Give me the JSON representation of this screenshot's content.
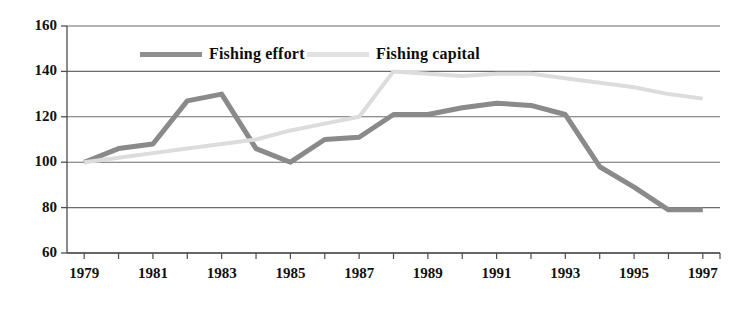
{
  "chart_data": {
    "type": "line",
    "title": "",
    "xlabel": "",
    "ylabel": "",
    "x": [
      1979,
      1980,
      1981,
      1982,
      1983,
      1984,
      1985,
      1986,
      1987,
      1988,
      1989,
      1990,
      1991,
      1992,
      1993,
      1994,
      1995,
      1996,
      1997
    ],
    "xlim": [
      1978.5,
      1997.5
    ],
    "ylim": [
      60,
      160
    ],
    "ytick_values": [
      60,
      80,
      100,
      120,
      140,
      160
    ],
    "ytick_labels": [
      "60",
      "80",
      "100",
      "120",
      "140",
      "160"
    ],
    "xtick_values": [
      1979,
      1981,
      1983,
      1985,
      1987,
      1989,
      1991,
      1993,
      1995,
      1997
    ],
    "xtick_labels": [
      "1979",
      "1981",
      "1983",
      "1985",
      "1987",
      "1989",
      "1991",
      "1993",
      "1995",
      "1997"
    ],
    "xtick_minor_values": [
      1980,
      1982,
      1984,
      1986,
      1988,
      1990,
      1992,
      1994,
      1996
    ],
    "grid": "horizontal",
    "legend_position": "top-inside",
    "series": [
      {
        "name": "Fishing effort",
        "color": "#8a8a8a",
        "line_width": 5,
        "values": [
          100,
          106,
          108,
          127,
          130,
          106,
          100,
          110,
          111,
          121,
          121,
          124,
          126,
          125,
          121,
          98,
          89,
          79,
          79
        ]
      },
      {
        "name": "Fishing capital",
        "color": "#dcdcdc",
        "line_width": 4,
        "values": [
          100,
          102,
          104,
          106,
          108,
          110,
          114,
          117,
          120,
          140,
          139,
          138,
          139,
          139,
          137,
          135,
          133,
          130,
          128
        ]
      }
    ]
  },
  "legend": {
    "entries": [
      {
        "label": "Fishing effort",
        "color": "#8f8f8f"
      },
      {
        "label": "Fishing capital",
        "color": "#e2e2e2"
      }
    ]
  },
  "axes": {
    "axis_color": "#4d4d4d",
    "grid_color": "#6b6b6b",
    "background": "#ffffff"
  }
}
